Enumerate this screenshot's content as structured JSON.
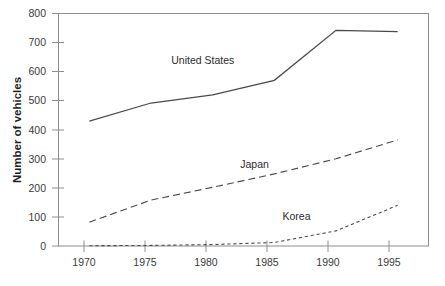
{
  "chart_data": {
    "type": "line",
    "title": "",
    "xlabel": "",
    "ylabel": "Number of vehicles",
    "x": [
      1970,
      1975,
      1980,
      1985,
      1990,
      1995
    ],
    "xtick_labels": [
      "1970",
      "1975",
      "1980",
      "1985",
      "1990",
      "1995"
    ],
    "ytick_labels": [
      "0",
      "100",
      "200",
      "300",
      "400",
      "500",
      "600",
      "700",
      "800"
    ],
    "yticks": [
      0,
      100,
      200,
      300,
      400,
      500,
      600,
      700,
      800
    ],
    "xlim": [
      1967.5,
      1997.5
    ],
    "ylim": [
      0,
      800
    ],
    "grid": false,
    "legend_position": "inline-labels",
    "series": [
      {
        "name": "United States",
        "label": "United States",
        "style": "solid",
        "color": "#4a4a4a",
        "values": [
          430,
          492,
          520,
          570,
          742,
          738
        ]
      },
      {
        "name": "Japan",
        "label": "Japan",
        "style": "long-dash",
        "color": "#4a4a4a",
        "values": [
          82,
          158,
          202,
          248,
          300,
          365
        ]
      },
      {
        "name": "Korea",
        "label": "Korea",
        "style": "short-dash",
        "color": "#4a4a4a",
        "values": [
          1,
          2,
          5,
          12,
          52,
          140
        ]
      }
    ],
    "annotations": [
      {
        "text": "United States",
        "x": 1979.2,
        "y": 625
      },
      {
        "text": "Japan",
        "x": 1983.4,
        "y": 268
      },
      {
        "text": "Korea",
        "x": 1986.8,
        "y": 88
      }
    ]
  },
  "axes": {
    "y_title": "Number of vehicles"
  },
  "colors": {
    "ink": "#2b2b2b",
    "axis": "#8d8d8d",
    "line": "#4a4a4a",
    "background": "#ffffff"
  }
}
